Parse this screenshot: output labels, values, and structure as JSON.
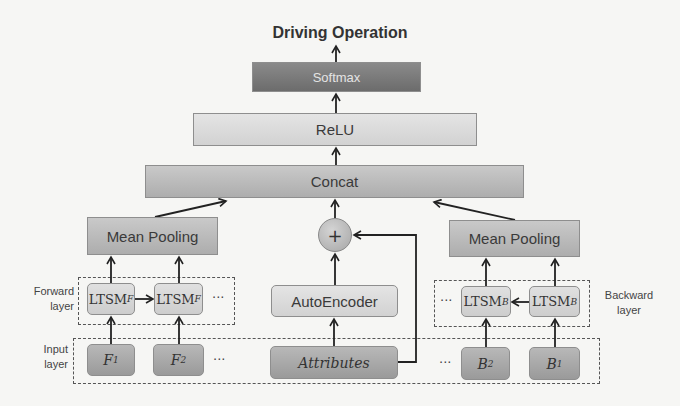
{
  "diagram": {
    "title": "Driving Operation",
    "layers": {
      "softmax": "Softmax",
      "relu": "ReLU",
      "concat": "Concat",
      "mean_pooling_left": "Mean Pooling",
      "mean_pooling_right": "Mean Pooling",
      "autoencoder": "AutoEncoder",
      "combine": "+"
    },
    "forward": {
      "label_line1": "Forward",
      "label_line2": "layer",
      "cells": [
        {
          "base": "LTSM",
          "sub": "F"
        },
        {
          "base": "LTSM",
          "sub": "F"
        }
      ],
      "ellipsis": "···"
    },
    "backward": {
      "label_line1": "Backward",
      "label_line2": "layer",
      "cells": [
        {
          "base": "LTSM",
          "sub": "B"
        },
        {
          "base": "LTSM",
          "sub": "B"
        }
      ],
      "ellipsis": "···"
    },
    "input": {
      "label_line1": "Input",
      "label_line2": "layer",
      "forward_inputs": [
        {
          "base": "F",
          "sub": "1"
        },
        {
          "base": "F",
          "sub": "2"
        }
      ],
      "attributes": "Attributes",
      "backward_inputs": [
        {
          "base": "B",
          "sub": "2"
        },
        {
          "base": "B",
          "sub": "1"
        }
      ],
      "ellipsis_left": "···",
      "ellipsis_right": "···"
    }
  },
  "colors": {
    "dark_box": "#7a7a7a",
    "light_box": "#dcdcdc",
    "mid_box": "#bcbcbc",
    "input_box": "#a8a8a8",
    "line": "#222222",
    "background": "#f6f6f4"
  }
}
